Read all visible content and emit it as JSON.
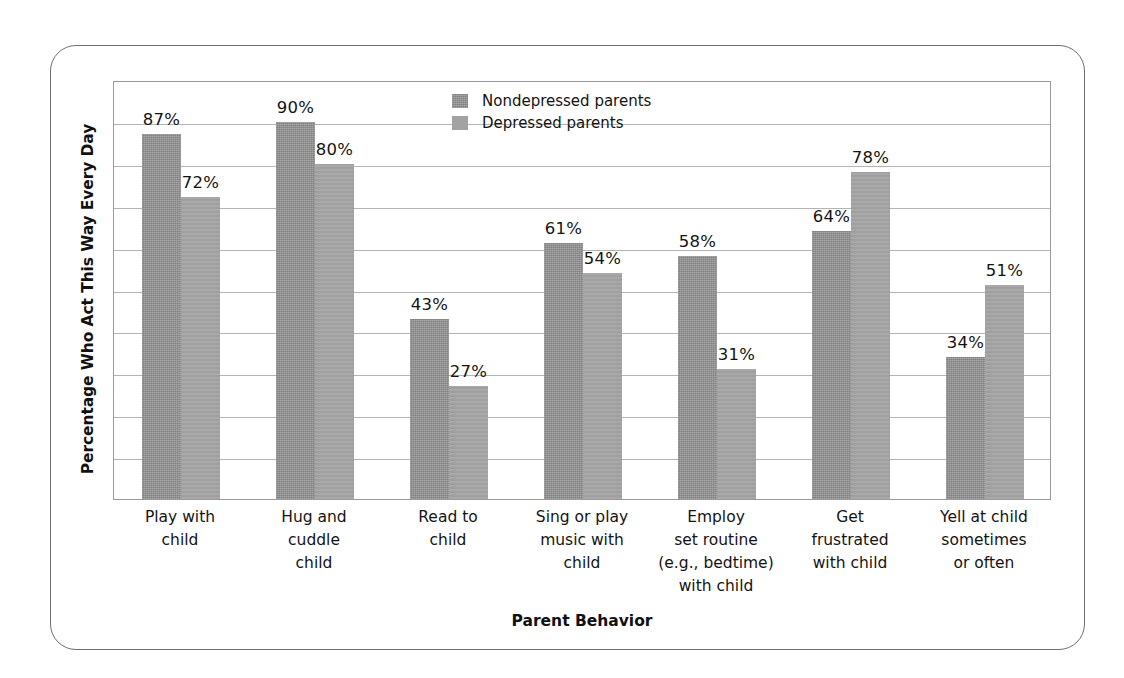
{
  "chart_data": {
    "type": "bar",
    "title": "",
    "xlabel": "Parent Behavior",
    "ylabel": "Percentage Who Act This Way Every Day",
    "ylim": [
      0,
      100
    ],
    "grid": true,
    "gridline_step": 10,
    "legend_position": "top-center",
    "value_suffix": "%",
    "categories": [
      [
        "Play with",
        "child"
      ],
      [
        "Hug and",
        "cuddle",
        "child"
      ],
      [
        "Read to",
        "child"
      ],
      [
        "Sing or play",
        "music with",
        "child"
      ],
      [
        "Employ",
        "set routine",
        "(e.g., bedtime)",
        "with child"
      ],
      [
        "Get",
        "frustrated",
        "with child"
      ],
      [
        "Yell at child",
        "sometimes",
        "or often"
      ]
    ],
    "category_labels_flat": [
      "Play with child",
      "Hug and cuddle child",
      "Read to child",
      "Sing or play music with child",
      "Employ set routine (e.g., bedtime) with child",
      "Get frustrated with child",
      "Yell at child sometimes or often"
    ],
    "series": [
      {
        "name": "Nondepressed parents",
        "color": "#8d8d8d",
        "values": [
          87,
          90,
          43,
          61,
          58,
          64,
          34
        ],
        "labels": [
          "87%",
          "90%",
          "43%",
          "61%",
          "58%",
          "64%",
          "34%"
        ]
      },
      {
        "name": "Depressed parents",
        "color": "#a2a2a2",
        "values": [
          72,
          80,
          27,
          54,
          31,
          78,
          51
        ],
        "labels": [
          "72%",
          "80%",
          "27%",
          "54%",
          "31%",
          "78%",
          "51%"
        ]
      }
    ]
  },
  "legend": {
    "items": [
      {
        "label": "Nondepressed parents",
        "swatch": "nondepressed"
      },
      {
        "label": "Depressed parents",
        "swatch": "depressed"
      }
    ]
  },
  "axes": {
    "y_title": "Percentage Who Act This Way Every Day",
    "x_title": "Parent Behavior"
  },
  "colors": {
    "series_nondepressed": "#8d8d8d",
    "series_depressed": "#a2a2a2",
    "gridline": "#b4b4b4",
    "plot_border": "#9a9a9a",
    "figure_border": "#6e6e72",
    "text": "#141414",
    "background": "#ffffff"
  }
}
